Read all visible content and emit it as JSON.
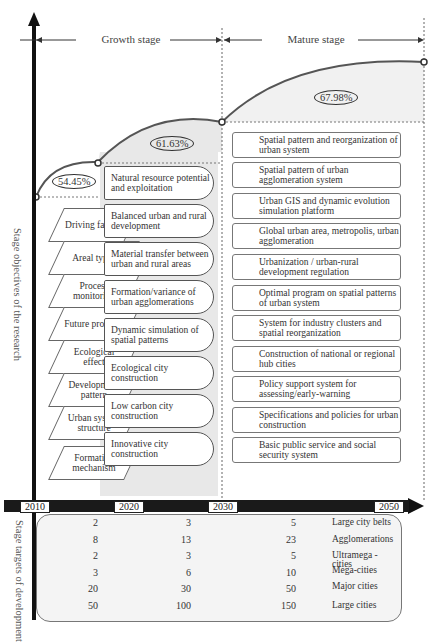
{
  "stages": {
    "growth": "Growth stage",
    "mature": "Mature stage"
  },
  "percentages": [
    "54.45%",
    "61.63%",
    "67.98%"
  ],
  "axis_labels": {
    "objectives": "Stage objectives of the research",
    "targets": "Stage targets of development"
  },
  "research_aspects": [
    "Driving factors",
    "Areal types",
    "Process monitoring",
    "Future prospect",
    "Ecological effect",
    "Development pattern",
    "Urban system structure",
    "Formation mechanism"
  ],
  "growth_objectives": [
    "Natural resource potential and exploitation",
    "Balanced urban and rural development",
    "Material transfer between urban and rural areas",
    "Formation/variance of urban agglomerations",
    "Dynamic simulation of spatial patterns",
    "Ecological city construction",
    "Low carbon city construction",
    "Innovative city construction"
  ],
  "mature_objectives": [
    "Spatial pattern and reorganization of urban system",
    "Spatial pattern of urban agglomeration system",
    "Urban GIS and dynamic evolution simulation platform",
    "Global urban area, metropolis, urban agglomeration",
    "Urbanization / urban-rural development regulation",
    "Optimal program on spatial patterns of urban system",
    "System for industry clusters and spatial reorganization",
    "Construction of national or regional hub cities",
    "Policy support system for assessing/early-warning",
    "Specifications and policies for urban construction",
    "Basic public service and social security system"
  ],
  "timeline": [
    "2010",
    "2020",
    "2030",
    "2050"
  ],
  "targets": {
    "columns": [
      "2020",
      "2030",
      "2050"
    ],
    "rows": [
      {
        "label": "Large city belts",
        "v2020": "2",
        "v2030": "3",
        "v2050": "5"
      },
      {
        "label": "Agglomerations",
        "v2020": "8",
        "v2030": "13",
        "v2050": "23"
      },
      {
        "label": "Ultramega - cities",
        "v2020": "2",
        "v2030": "3",
        "v2050": "5"
      },
      {
        "label": "Mega-cities",
        "v2020": "3",
        "v2030": "6",
        "v2050": "10"
      },
      {
        "label": "Major cities",
        "v2020": "20",
        "v2030": "30",
        "v2050": "50"
      },
      {
        "label": "Large cities",
        "v2020": "50",
        "v2030": "100",
        "v2050": "150"
      },
      {
        "label": "Medium-sized cities",
        "v2020": "200",
        "v2030": "150",
        "v2050": "150"
      },
      {
        "label": "Small cities",
        "v2020": "350",
        "v2030": "300",
        "v2050": "250"
      }
    ]
  },
  "colors": {
    "axis": "#111111",
    "shade": "#e6e6e6",
    "curve": "#555555"
  }
}
